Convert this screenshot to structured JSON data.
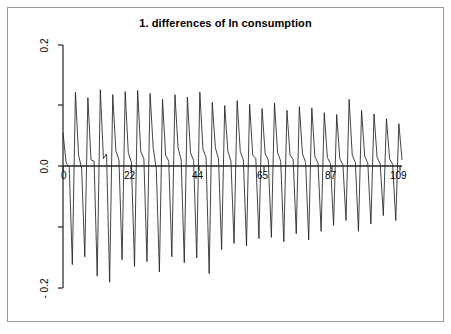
{
  "chart_data": {
    "type": "line",
    "title": "1. differences of ln consumption",
    "xlabel": "",
    "ylabel": "",
    "xlim": [
      0,
      109
    ],
    "ylim": [
      -0.2,
      0.2
    ],
    "grid": false,
    "legend": "none",
    "x_ticks": [
      "0",
      "22",
      "44",
      "65",
      "87",
      "109"
    ],
    "x_tick_values": [
      0,
      22,
      44,
      65,
      87,
      109
    ],
    "y_ticks": [
      "0.2",
      "0.0",
      "- 0.2"
    ],
    "y_tick_values": [
      0.2,
      0.0,
      -0.2
    ],
    "y_minor_tick_values": [
      0.1,
      -0.1
    ],
    "line_color": "#222222",
    "zero_line_color": "#222222",
    "series": [
      {
        "name": "1. differences of ln consumption",
        "x": [
          0,
          1,
          2,
          3,
          4,
          5,
          6,
          7,
          8,
          9,
          10,
          11,
          12,
          13,
          14,
          15,
          16,
          17,
          18,
          19,
          20,
          21,
          22,
          23,
          24,
          25,
          26,
          27,
          28,
          29,
          30,
          31,
          32,
          33,
          34,
          35,
          36,
          37,
          38,
          39,
          40,
          41,
          42,
          43,
          44,
          45,
          46,
          47,
          48,
          49,
          50,
          51,
          52,
          53,
          54,
          55,
          56,
          57,
          58,
          59,
          60,
          61,
          62,
          63,
          64,
          65,
          66,
          67,
          68,
          69,
          70,
          71,
          72,
          73,
          74,
          75,
          76,
          77,
          78,
          79,
          80,
          81,
          82,
          83,
          84,
          85,
          86,
          87,
          88,
          89,
          90,
          91,
          92,
          93,
          94,
          95,
          96,
          97,
          98,
          99,
          100,
          101,
          102,
          103,
          104,
          105,
          106,
          107,
          108,
          109
        ],
        "values": [
          0.055,
          0.005,
          -0.002,
          -0.163,
          0.122,
          0.018,
          -0.004,
          -0.15,
          0.113,
          0.01,
          0.008,
          -0.182,
          0.126,
          0.012,
          0.02,
          -0.192,
          0.118,
          0.025,
          0.01,
          -0.155,
          0.123,
          0.022,
          0.006,
          -0.166,
          0.125,
          0.024,
          0.012,
          -0.158,
          0.12,
          0.03,
          -0.005,
          -0.175,
          0.11,
          0.018,
          0.008,
          -0.15,
          0.118,
          0.03,
          0.01,
          -0.16,
          0.114,
          0.022,
          0.009,
          -0.152,
          0.122,
          0.028,
          0.014,
          -0.178,
          0.105,
          0.03,
          0.012,
          -0.138,
          0.1,
          0.025,
          0.008,
          -0.128,
          0.108,
          0.024,
          0.01,
          -0.132,
          0.102,
          0.018,
          0.012,
          -0.12,
          0.095,
          0.02,
          0.01,
          -0.118,
          0.104,
          0.022,
          0.008,
          -0.125,
          0.092,
          0.018,
          0.011,
          -0.112,
          0.098,
          0.02,
          0.006,
          -0.122,
          0.096,
          0.015,
          0.005,
          -0.108,
          0.088,
          0.014,
          0.004,
          -0.098,
          0.085,
          0.012,
          0.002,
          -0.09,
          0.11,
          0.018,
          0.006,
          -0.108,
          0.092,
          0.016,
          0.005,
          -0.096,
          0.086,
          0.014,
          0.004,
          -0.082,
          0.078,
          0.012,
          0.003,
          -0.09,
          0.07,
          0.01
        ]
      }
    ]
  },
  "axis": {
    "y_label_top": "0.2",
    "y_label_mid": "0.0",
    "y_label_bottom": "- 0.2",
    "x_label_0": "0",
    "x_label_22": "22",
    "x_label_44": "44",
    "x_label_65": "65",
    "x_label_87": "87",
    "x_label_109": "109"
  }
}
